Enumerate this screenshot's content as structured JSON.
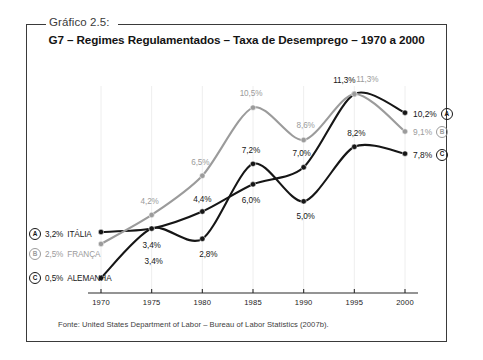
{
  "caption": "Gráfico 2.5:",
  "title": "G7 – Regimes Regulamentados – Taxa de Desemprego – 1970 a 2000",
  "source": "Fonte: United States Department of Labor – Bureau of Labor Statistics (2007b).",
  "colors": {
    "dark": "#161616",
    "gray": "#9b9b9b",
    "frame": "#3a3a3a",
    "background": "#ffffff"
  },
  "legend": [
    {
      "badge": "A",
      "value": "3,2%",
      "label": "ITÁLIA",
      "tone": "dark"
    },
    {
      "badge": "B",
      "value": "2,5%",
      "label": "FRANÇA",
      "tone": "gray"
    },
    {
      "badge": "C",
      "value": "0,5%",
      "label": "ALEMANHA",
      "tone": "dark"
    }
  ],
  "end_labels": [
    {
      "badge": "A",
      "value": "10,2%",
      "tone": "dark"
    },
    {
      "badge": "B",
      "value": "9,1%",
      "tone": "gray"
    },
    {
      "badge": "C",
      "value": "7,8%",
      "tone": "dark"
    }
  ],
  "chart_data": {
    "type": "line",
    "title": "G7 – Regimes Regulamentados – Taxa de Desemprego – 1970 a 2000",
    "xlabel": "",
    "ylabel": "",
    "categories": [
      "1970",
      "1975",
      "1980",
      "1985",
      "1990",
      "1995",
      "2000"
    ],
    "x": [
      1970,
      1975,
      1980,
      1985,
      1990,
      1995,
      2000
    ],
    "ylim": [
      0,
      12
    ],
    "grid": false,
    "legend_position": "left-and-right-endpoints",
    "series": [
      {
        "name": "ITÁLIA",
        "badge": "A",
        "color": "#161616",
        "values": [
          3.2,
          3.4,
          4.4,
          6.0,
          7.0,
          11.3,
          10.2
        ],
        "labels": [
          "3,2%",
          "3,4%",
          "4,4%",
          "6,0%",
          "7,0%",
          "11,3%",
          "10,2%"
        ],
        "shown_point_labels": [
          "",
          "3,4%",
          "4,4%",
          "6,0%",
          "7,0%",
          "11,3%",
          ""
        ]
      },
      {
        "name": "FRANÇA",
        "badge": "B",
        "color": "#9b9b9b",
        "values": [
          2.5,
          4.2,
          6.5,
          10.5,
          8.6,
          11.3,
          9.1
        ],
        "labels": [
          "2,5%",
          "4,2%",
          "6,5%",
          "10,5%",
          "8,6%",
          "11,3%",
          "9,1%"
        ],
        "shown_point_labels": [
          "",
          "4,2%",
          "6,5%",
          "10,5%",
          "8,6%",
          "11,3%",
          ""
        ]
      },
      {
        "name": "ALEMANHA",
        "badge": "C",
        "color": "#161616",
        "values": [
          0.5,
          3.4,
          2.8,
          7.2,
          5.0,
          8.2,
          7.8
        ],
        "labels": [
          "0,5%",
          "3,4%",
          "2,8%",
          "7,2%",
          "5,0%",
          "8,2%",
          "7,8%"
        ],
        "shown_point_labels": [
          "",
          "3,4%",
          "2,8%",
          "7,2%",
          "5,0%",
          "8,2%",
          ""
        ]
      }
    ]
  }
}
